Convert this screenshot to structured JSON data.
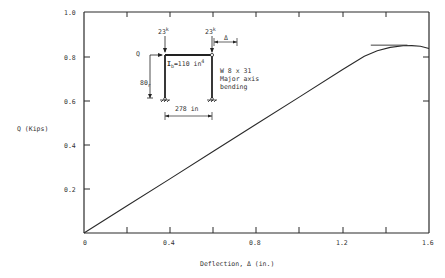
{
  "chart_data": {
    "type": "line",
    "title": "",
    "xlabel": "Deflection, Δ (in.)",
    "ylabel": "Q (Kips)",
    "xlim": [
      0,
      1.6
    ],
    "ylim": [
      0,
      1.0
    ],
    "x_ticks": [
      "0",
      "0.4",
      "0.8",
      "1.2",
      "1.6"
    ],
    "y_ticks": [
      "0.2",
      "0.4",
      "0.6",
      "0.8",
      "1.0"
    ],
    "grid": false,
    "series": [
      {
        "name": "Load-deflection",
        "x": [
          0,
          0.2,
          0.4,
          0.6,
          0.8,
          1.0,
          1.2,
          1.3,
          1.36,
          1.42,
          1.48,
          1.52,
          1.56,
          1.6
        ],
        "y": [
          0,
          0.123,
          0.246,
          0.37,
          0.493,
          0.616,
          0.74,
          0.8,
          0.825,
          0.84,
          0.847,
          0.848,
          0.845,
          0.835
        ]
      }
    ],
    "reference_line": {
      "y": 0.85,
      "x_range": [
        1.33,
        1.5
      ]
    },
    "annotations": {
      "load_left": "23",
      "load_right": "23",
      "load_unit_sup": "k",
      "lateral_load": "Q",
      "delta": "Δ",
      "height": "80",
      "height_suffix": "r",
      "beam_inertia": "I",
      "beam_inertia_sub": "b",
      "beam_inertia_value": "=110 in",
      "beam_inertia_sup": "4",
      "span": "278 in",
      "section_line1": "W 8 x 31",
      "section_line2": "Major axis",
      "section_line3": "bending"
    }
  }
}
